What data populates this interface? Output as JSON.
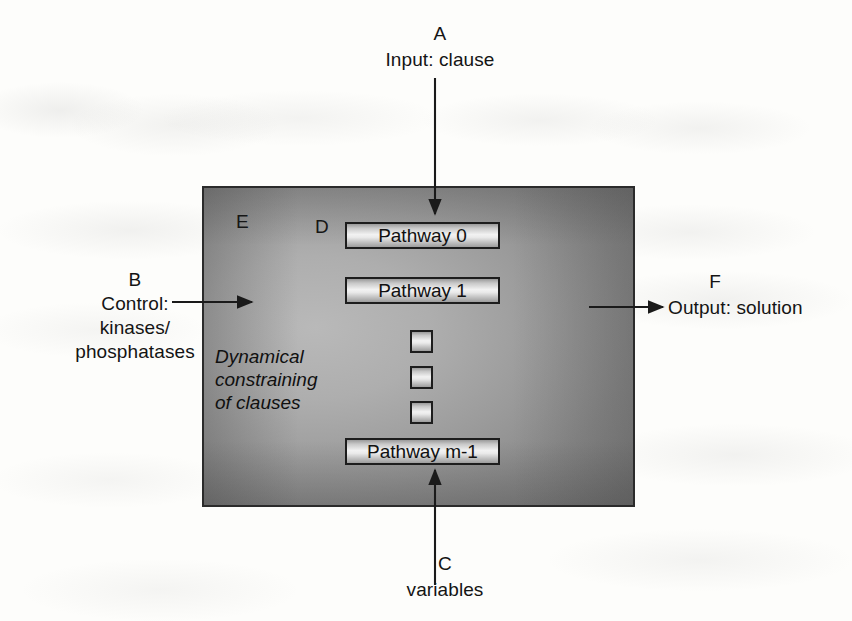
{
  "figure": {
    "background_color": "#fdfdfb",
    "panel_color": "#a5a5a5",
    "ink_color": "#141414"
  },
  "annotations": {
    "a": {
      "tag": "A",
      "text": "Input: clause"
    },
    "b": {
      "tag": "B",
      "line1": "Control:",
      "line2": "kinases/",
      "line3": "phosphatases"
    },
    "c": {
      "tag": "C",
      "text": "variables"
    },
    "f": {
      "tag": "F",
      "text": "Output: solution"
    },
    "d": {
      "tag": "D"
    },
    "e": {
      "tag": "E"
    }
  },
  "panel": {
    "note": {
      "line1": "Dynamical",
      "line2": "constraining",
      "line3": "of clauses"
    },
    "pathways": [
      {
        "label": "Pathway 0"
      },
      {
        "label": "Pathway 1"
      },
      {
        "label": "Pathway m-1"
      }
    ],
    "ellipsis_count": 3
  }
}
